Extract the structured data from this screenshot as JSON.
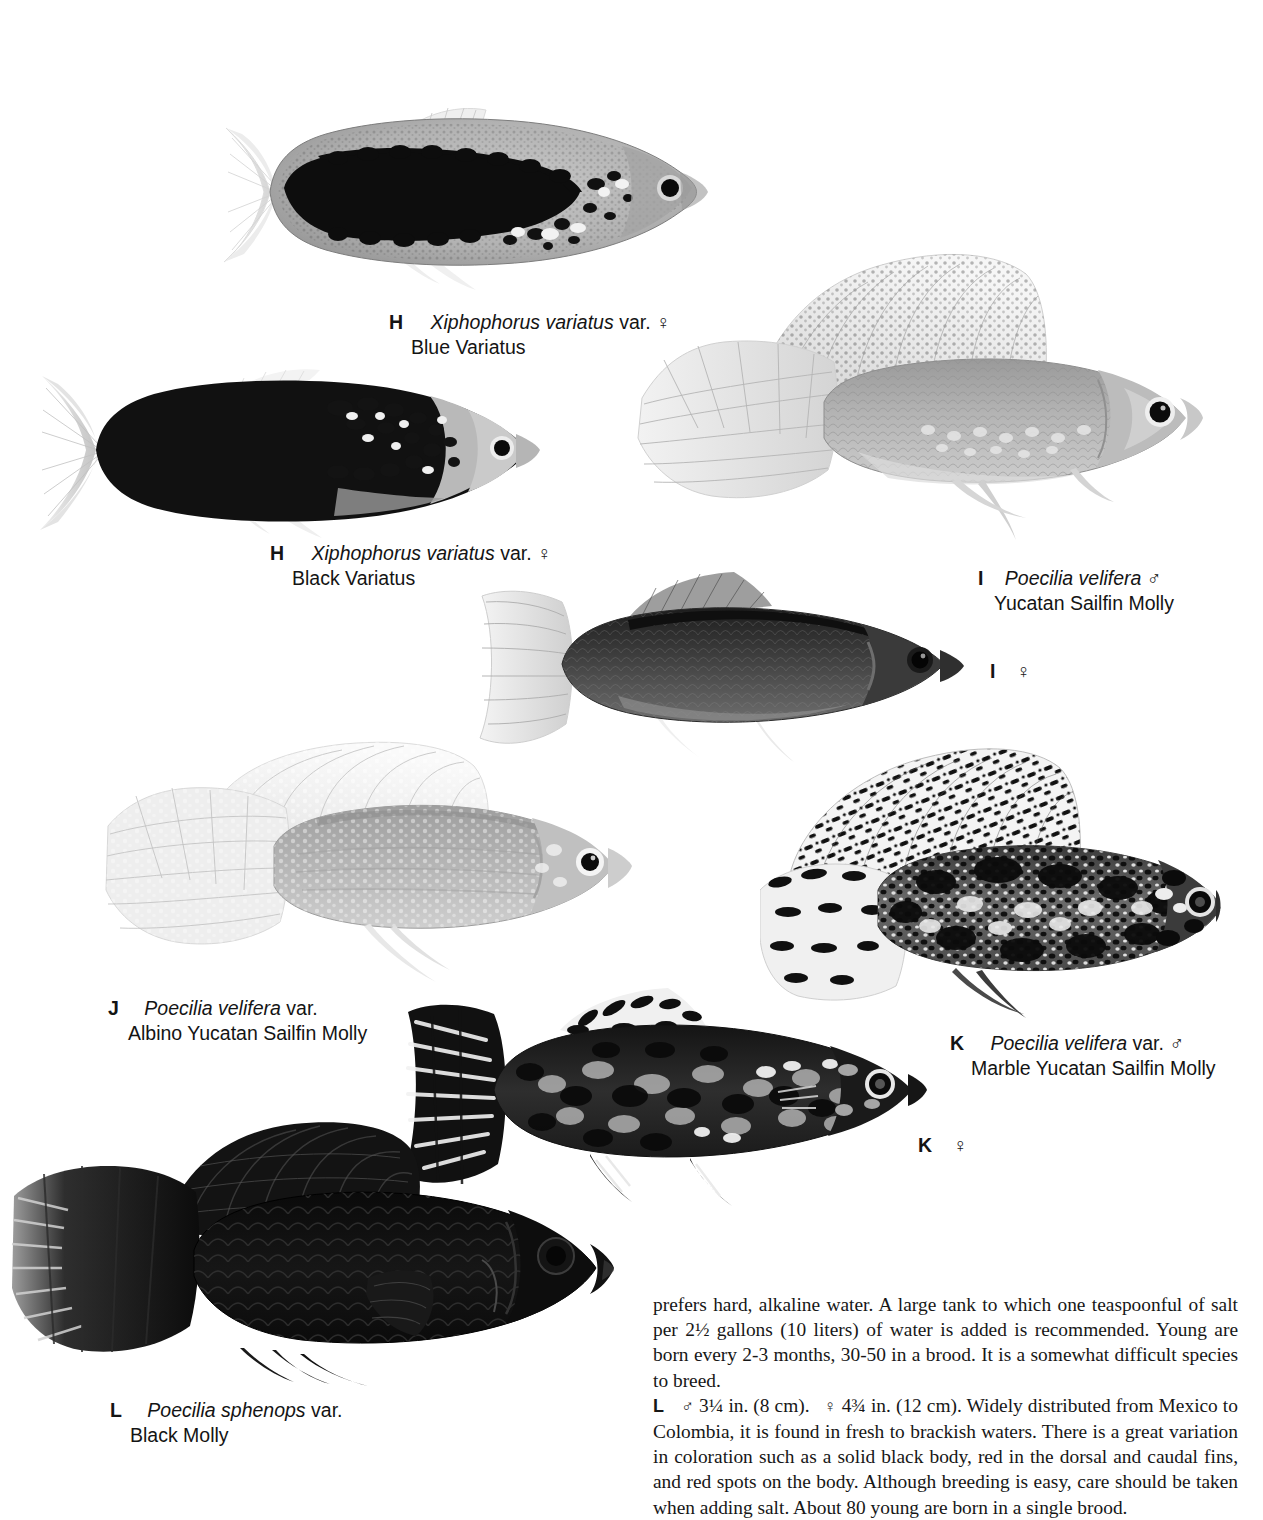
{
  "page": {
    "background": "#ffffff",
    "ink": "#141414"
  },
  "figures": [
    {
      "id": "H-blue-variatus",
      "name": "fish-blue-variatus",
      "style": "blotched-dark-midband",
      "species": "Xiphophorus variatus var.",
      "common": "Blue Variatus"
    },
    {
      "id": "H-black-variatus",
      "name": "fish-black-variatus",
      "style": "solid-black-body",
      "species": "Xiphophorus variatus var.",
      "common": "Black Variatus"
    },
    {
      "id": "I-male-sailfin",
      "name": "fish-yucatan-sailfin-molly-male",
      "style": "pale-sailfin",
      "species": "Poecilia velifera",
      "common": "Yucatan Sailfin Molly"
    },
    {
      "id": "I-female",
      "name": "fish-yucatan-sailfin-molly-female",
      "style": "dark-grey-female",
      "species": "Poecilia velifera",
      "common": "Yucatan Sailfin Molly"
    },
    {
      "id": "J-albino",
      "name": "fish-albino-yucatan-sailfin-molly",
      "style": "pale-albino-sailfin",
      "species": "Poecilia velifera var.",
      "common": "Albino Yucatan Sailfin Molly"
    },
    {
      "id": "K-male-marble",
      "name": "fish-marble-yucatan-sailfin-molly-male",
      "style": "marble-mottled-sailfin",
      "species": "Poecilia velifera var.",
      "common": "Marble Yucatan Sailfin Molly"
    },
    {
      "id": "K-female-marble",
      "name": "fish-marble-yucatan-sailfin-molly-female",
      "style": "marble-mottled-female",
      "species": "Poecilia velifera var.",
      "common": "Marble Yucatan Sailfin Molly"
    },
    {
      "id": "L-black-molly",
      "name": "fish-black-molly",
      "style": "solid-black-sailfin",
      "species": "Poecilia sphenops var.",
      "common": "Black Molly"
    }
  ],
  "captions": {
    "h_blue": {
      "letter": "H",
      "sci": "Xiphophorus variatus",
      "var": "var.",
      "sex": "♀",
      "common": "Blue Variatus"
    },
    "h_black": {
      "letter": "H",
      "sci": "Xiphophorus variatus",
      "var": "var.",
      "sex": "♀",
      "common": "Black Variatus"
    },
    "i_male": {
      "letter": "I",
      "sci": "Poecilia velifera",
      "var": "",
      "sex": "♂",
      "common": "Yucatan Sailfin Molly"
    },
    "i_female": {
      "letter": "I",
      "sex": "♀"
    },
    "j_albino": {
      "letter": "J",
      "sci": "Poecilia velifera",
      "var": "var.",
      "sex": "",
      "common": "Albino Yucatan Sailfin Molly"
    },
    "k_male": {
      "letter": "K",
      "sci": "Poecilia velifera",
      "var": "var.",
      "sex": "♂",
      "common": "Marble Yucatan Sailfin Molly"
    },
    "k_female": {
      "letter": "K",
      "sex": "♀"
    },
    "l_black": {
      "letter": "L",
      "sci": "Poecilia sphenops",
      "var": "var.",
      "sex": "",
      "common": "Black Molly"
    }
  },
  "body": {
    "para1": "prefers hard, alkaline water. A large tank to which one teaspoonful of salt per 2½ gallons (10 liters) of water is added is recommended. Young are born every 2-3 months, 30-50 in a brood. It is a somewhat difficult species to breed.",
    "entry_l": {
      "letter": "L",
      "male_sex": "♂",
      "male_size": "3¼ in. (8 cm).",
      "female_sex": "♀",
      "female_size": "4¾ in. (12 cm).",
      "text": "Widely distributed from Mexico to Colombia, it is found in fresh to brackish waters. There is a great variation in coloration such as a solid black body, red in the dorsal and caudal fins, and red spots on the body. Although breeding is easy, care should be taken when adding salt. About 80 young are born in a single brood."
    }
  }
}
